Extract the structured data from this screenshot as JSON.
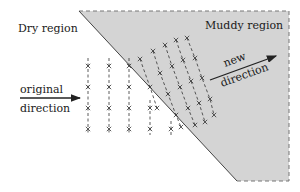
{
  "diagram": {
    "labels": {
      "dry_region": "Dry region",
      "muddy_region": "Muddy region",
      "original_line1": "original",
      "original_line2": "direction",
      "new_line1": "new",
      "new_line2": "direction"
    },
    "colors": {
      "muddy_fill": "#d4d4d4",
      "line": "#333333",
      "boundary_dash": "#777777"
    },
    "muddy_polygon": [
      [
        79,
        11
      ],
      [
        289,
        11
      ],
      [
        289,
        181
      ],
      [
        237,
        181
      ]
    ],
    "dry_wavefronts": [
      {
        "x": 88,
        "rows": [
          66,
          87,
          108,
          129
        ]
      },
      {
        "x": 109,
        "rows": [
          66,
          87,
          108,
          129
        ]
      },
      {
        "x": 129,
        "rows": [
          66,
          87,
          108,
          129
        ]
      },
      {
        "x": 150,
        "rows": [
          108,
          129
        ]
      },
      {
        "x": 171,
        "rows": [
          129
        ]
      }
    ],
    "muddy_wavefronts": [
      {
        "points": [
          [
            140,
            59
          ],
          [
            150,
            87
          ],
          [
            157,
            108
          ]
        ]
      },
      {
        "points": [
          [
            153,
            51
          ],
          [
            160,
            73
          ],
          [
            168,
            94
          ],
          [
            176,
            115
          ],
          [
            181,
            127
          ]
        ]
      },
      {
        "points": [
          [
            165,
            45
          ],
          [
            172,
            66
          ],
          [
            180,
            87
          ],
          [
            188,
            108
          ],
          [
            195,
            125
          ]
        ]
      },
      {
        "points": [
          [
            176,
            40
          ],
          [
            183,
            60
          ],
          [
            191,
            81
          ],
          [
            199,
            103
          ],
          [
            205,
            122
          ]
        ]
      },
      {
        "points": [
          [
            187,
            38
          ],
          [
            195,
            58
          ],
          [
            202,
            78
          ],
          [
            210,
            99
          ],
          [
            214,
            115
          ]
        ]
      }
    ]
  }
}
